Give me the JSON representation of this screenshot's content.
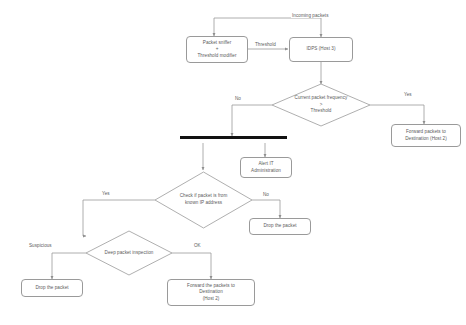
{
  "diagram": {
    "type": "flowchart",
    "stroke_color": "#9a9a9a",
    "text_color": "#5b5b5b",
    "bar_color": "#111111",
    "background": "#ffffff"
  },
  "nodes": {
    "incoming_packets": {
      "label": "Incoming packets",
      "shape": "label"
    },
    "packet_sniffer": {
      "line1": "Packet sniffer",
      "line2": "+",
      "line3": "Threshold modifier",
      "shape": "rounded-rect"
    },
    "idps": {
      "label": "IDPS (Host 3)",
      "shape": "rounded-rect"
    },
    "freq_decision": {
      "line1": "Current packet frequency",
      "line2": ">",
      "line3": "Threshold",
      "shape": "diamond"
    },
    "forward_host2_right": {
      "line1": "Forward packets to",
      "line2": "Destination (Host 2)",
      "shape": "rounded-rect"
    },
    "sync_bar": {
      "label": "",
      "shape": "synchronization-bar"
    },
    "alert_it": {
      "line1": "Alert IT",
      "line2": "Administration",
      "shape": "rounded-rect"
    },
    "known_ip_decision": {
      "line1": "Check if packet is from",
      "line2": "known IP address",
      "shape": "diamond"
    },
    "drop_packet_right": {
      "label": "Drop the packet",
      "shape": "rounded-rect"
    },
    "deep_inspection": {
      "label": "Deep packet inspection",
      "shape": "diamond"
    },
    "drop_packet_left": {
      "label": "Drop the packet",
      "shape": "rounded-rect"
    },
    "forward_host2_bottom": {
      "line1": "Forward the packets to",
      "line2": "Destination",
      "line3": "(Host 2)",
      "shape": "rounded-rect"
    }
  },
  "edge_labels": {
    "threshold": "Threshold",
    "freq_no": "No",
    "freq_yes": "Yes",
    "ip_yes": "Yes",
    "ip_no": "No",
    "inspection_suspicious": "Suspicious",
    "inspection_ok": "OK"
  }
}
